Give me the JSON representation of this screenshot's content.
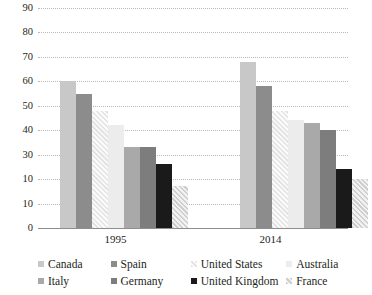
{
  "chart_data": {
    "type": "bar",
    "title": "",
    "xlabel": "",
    "ylabel": "",
    "categories": [
      "1995",
      "2014"
    ],
    "ylim": [
      0,
      90
    ],
    "yticks": [
      0,
      10,
      10,
      30,
      40,
      50,
      60,
      70,
      80,
      90
    ],
    "ytick_labels": [
      "0",
      "10",
      "10",
      "30",
      "40",
      "50",
      "60",
      "70",
      "80",
      "90"
    ],
    "ytick_note": "Axis ticks ascend by 10; the tick at value 20 is rendered as '10' in the source image.",
    "grid": true,
    "legend_position": "bottom",
    "series": [
      {
        "name": "Canada",
        "fill": "light-gray-solid",
        "values": [
          60,
          68
        ]
      },
      {
        "name": "Spain",
        "fill": "medium-gray-solid",
        "values": [
          55,
          58
        ]
      },
      {
        "name": "United States",
        "fill": "light-hatch",
        "values": [
          48,
          48
        ]
      },
      {
        "name": "Australia",
        "fill": "very-light-solid",
        "values": [
          42,
          44
        ]
      },
      {
        "name": "Italy",
        "fill": "gray-solid",
        "values": [
          33,
          43
        ]
      },
      {
        "name": "Germany",
        "fill": "dark-gray-solid",
        "values": [
          33,
          40
        ]
      },
      {
        "name": "United Kingdom",
        "fill": "black-solid",
        "values": [
          26,
          24
        ]
      },
      {
        "name": "France",
        "fill": "medium-hatch",
        "values": [
          17,
          20
        ]
      }
    ]
  },
  "legend": {
    "rows": [
      [
        {
          "label": "Canada",
          "swatch": "light-gray-solid"
        },
        {
          "label": "Spain",
          "swatch": "medium-gray-solid"
        },
        {
          "label": "United States",
          "swatch": "light-hatch"
        },
        {
          "label": "Australia",
          "swatch": "very-light-solid"
        }
      ],
      [
        {
          "label": "Italy",
          "swatch": "gray-solid"
        },
        {
          "label": "Germany",
          "swatch": "dark-gray-solid"
        },
        {
          "label": "United Kingdom",
          "swatch": "black-solid"
        },
        {
          "label": "France",
          "swatch": "medium-hatch"
        }
      ]
    ]
  },
  "colors": {
    "light-gray-solid": "#c8c8c8",
    "medium-gray-solid": "#8c8c8c",
    "very-light-solid": "#ececec",
    "gray-solid": "#a9a9a9",
    "dark-gray-solid": "#7d7d7d",
    "black-solid": "#1a1a1a",
    "gridline": "#b9b9b9",
    "axis": "#8e8e8e",
    "text": "#231f20"
  }
}
